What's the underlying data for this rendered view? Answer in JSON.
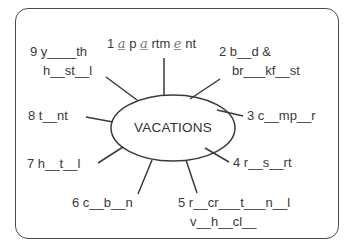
{
  "diagram": {
    "type": "word-web",
    "center": "VACATIONS",
    "colors": {
      "stroke": "#3a3a3a",
      "text": "#3a3a3a",
      "filled_letters": "#777777"
    },
    "items": [
      {
        "number": "1",
        "lines": [
          "a p a rtm e nt"
        ],
        "parts": [
          {
            "t": "1 ",
            "hw": false
          },
          {
            "t": "a",
            "hw": true
          },
          {
            "t": " p ",
            "hw": false
          },
          {
            "t": "a",
            "hw": true
          },
          {
            "t": " rtm ",
            "hw": false
          },
          {
            "t": "e",
            "hw": true
          },
          {
            "t": " nt",
            "hw": false
          }
        ]
      },
      {
        "number": "2",
        "lines": [
          "2 b _ d &",
          "br _ _ kf _ st"
        ]
      },
      {
        "number": "3",
        "lines": [
          "3 c _ mp _ r"
        ]
      },
      {
        "number": "4",
        "lines": [
          "4 r _ s _ rt"
        ]
      },
      {
        "number": "5",
        "lines": [
          "5 r _ cr _ _ t _ _ n _ l",
          "v _ h _ cl _"
        ]
      },
      {
        "number": "6",
        "lines": [
          "6 c _ b _ n"
        ]
      },
      {
        "number": "7",
        "lines": [
          "7 h _ t _ l"
        ]
      },
      {
        "number": "8",
        "lines": [
          "8 t _ nt"
        ]
      },
      {
        "number": "9",
        "lines": [
          "9 y _ _ _ th",
          "h _ st _ l"
        ]
      }
    ]
  },
  "labels": {
    "l1a": "1 ",
    "l1b": "a",
    "l1c": " p ",
    "l1d": "a",
    "l1e": " rtm ",
    "l1f": "e",
    "l1g": " nt",
    "l2a": "2 b__d &",
    "l2b": "br___kf__st",
    "l3": "3 c__mp__r",
    "l4": "4 r__s__rt",
    "l5a": "5 r__cr___t___n__l",
    "l5b": "v__h__cl__",
    "l6": "6 c__b__n",
    "l7": "7 h__t__l",
    "l8": "8 t__nt",
    "l9a": "9 y____th",
    "l9b": "h__st__l"
  }
}
